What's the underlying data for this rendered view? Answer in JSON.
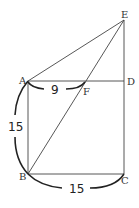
{
  "diagram": {
    "type": "geometry",
    "points": {
      "A": {
        "label": "A",
        "x": 28,
        "y": 81
      },
      "B": {
        "label": "B",
        "x": 28,
        "y": 174
      },
      "C": {
        "label": "C",
        "x": 124,
        "y": 174
      },
      "D": {
        "label": "D",
        "x": 124,
        "y": 81
      },
      "E": {
        "label": "E",
        "x": 124,
        "y": 20
      },
      "F": {
        "label": "F",
        "x": 85,
        "y": 81
      }
    },
    "segments": [
      "AB",
      "BC",
      "CD",
      "DA",
      "CE",
      "AE",
      "BE"
    ],
    "measurements": {
      "AF": "9",
      "AB": "15",
      "BC": "15"
    }
  }
}
